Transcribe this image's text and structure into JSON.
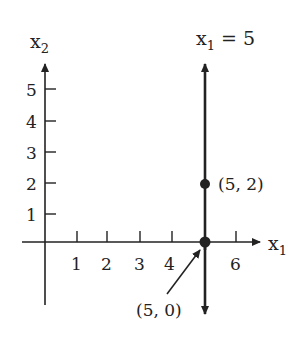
{
  "diagram": {
    "type": "coordinate-plane",
    "title_equation": "x₁ = 5",
    "axes": {
      "x_label": "x",
      "x_label_sub": "1",
      "y_label": "x",
      "y_label_sub": "2",
      "x_ticks": [
        "1",
        "2",
        "3",
        "4",
        "6"
      ],
      "y_ticks": [
        "1",
        "2",
        "3",
        "4",
        "5"
      ]
    },
    "line": {
      "equation_var": "x",
      "equation_sub": "1",
      "equation_rest": " = 5",
      "x_value": 5
    },
    "points": [
      {
        "label": "(5, 2)",
        "x": 5,
        "y": 2
      },
      {
        "label": "(5, 0)",
        "x": 5,
        "y": 0
      }
    ],
    "colors": {
      "ink": "#222222",
      "background": "#ffffff"
    }
  }
}
